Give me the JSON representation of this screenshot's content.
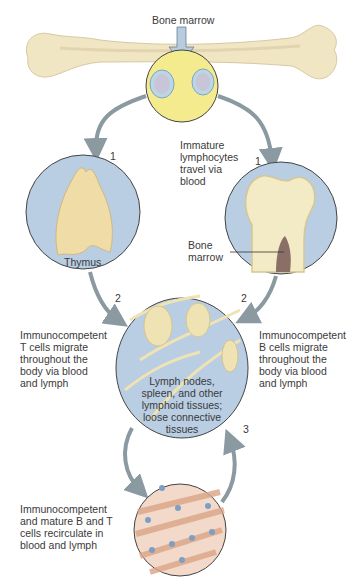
{
  "diagram": {
    "colors": {
      "bone": "#f1e6c4",
      "yellow_circle": "#f4ea8e",
      "blue_circle": "#b9cde3",
      "arrow": "#8a9aa0",
      "muscle_bg": "#f2d9c9",
      "muscle_fiber": "#d9a487"
    },
    "labels": {
      "bone_marrow_top": "Bone marrow",
      "immature": "Immature\nlymphocytes\ntravel via\nblood",
      "thymus": "Thymus",
      "bone_marrow_inset": "Bone\nmarrow",
      "t_cells": "Immunocompetent\nT cells migrate\nthroughout the\nbody via blood\nand lymph",
      "b_cells": "Immunocompetent\nB cells migrate\nthroughout the\nbody via blood\nand lymph",
      "lymph_nodes": "Lymph nodes,\nspleen, and other\nlymphoid tissues;\nloose connective\ntissues",
      "recirculate": "Immunocompetent\nand mature B and T\ncells recirculate in\nblood and lymph"
    },
    "steps": {
      "left_1": "1",
      "right_1": "1",
      "left_2": "2",
      "right_2": "2",
      "step_3": "3"
    }
  }
}
